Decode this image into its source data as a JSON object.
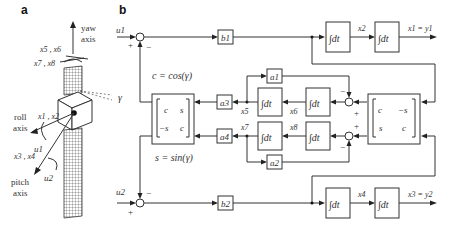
{
  "panels": {
    "a": {
      "label": "a",
      "yaw_axis": [
        "yaw",
        "axis"
      ],
      "roll_axis": [
        "roll",
        "axis"
      ],
      "pitch_axis": [
        "pitch",
        "axis"
      ],
      "x56": "x5 , x6",
      "x78": "x7 , x8",
      "x12": "x1 , x2",
      "x34": "x3 , x4",
      "u1": "u1",
      "u2": "u2",
      "gamma": "γ"
    },
    "b": {
      "label": "b",
      "inputs": {
        "u1": "u1",
        "u2": "u2"
      },
      "gains": {
        "b1": "b1",
        "b2": "b2",
        "a1": "a1",
        "a2": "a2",
        "a3": "a3",
        "a4": "a4"
      },
      "integrator_label": "∫dt",
      "signals": {
        "x2": "x2",
        "x4": "x4",
        "x5": "x5",
        "x6": "x6",
        "x7": "x7",
        "x8": "x8"
      },
      "outputs": {
        "y1": "x1 = y1",
        "y2": "x3 = y2"
      },
      "c_eq": "c = cos(γ)",
      "s_eq": "s = sin(γ)",
      "matrix_left": [
        [
          "c",
          "s"
        ],
        [
          "−s",
          "c"
        ]
      ],
      "matrix_right": [
        [
          "c",
          "−s"
        ],
        [
          "s",
          "c"
        ]
      ],
      "signs": {
        "plus": "+",
        "minus": "−"
      }
    }
  }
}
